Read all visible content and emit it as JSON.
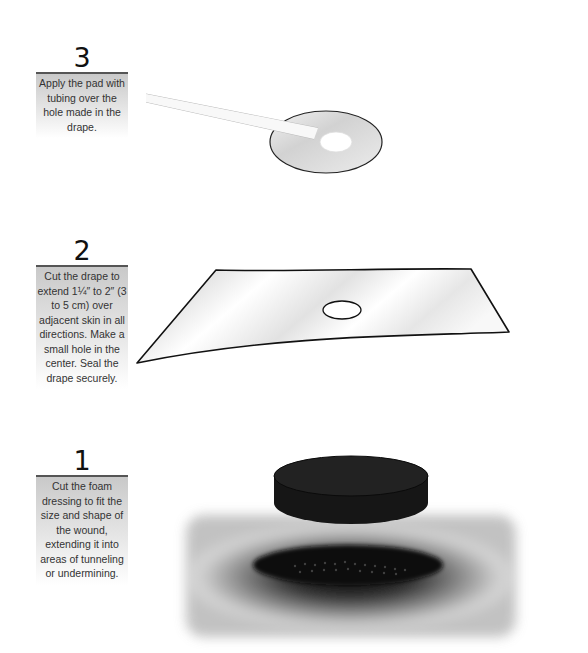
{
  "steps": [
    {
      "number": "3",
      "text": "Apply the pad with tubing over the hole made in the drape."
    },
    {
      "number": "2",
      "text": "Cut the drape to extend 1¼″ to 2″ (3 to 5 cm) over adjacent skin in all directions. Make a small hole in the center. Seal the drape securely."
    },
    {
      "number": "1",
      "text": "Cut the foam dressing to fit the size and shape of the wound, extending it into areas of tunneling or undermining."
    }
  ],
  "illustrations": {
    "step3": "pad-with-tubing-on-drape",
    "step2": "transparent-drape-with-center-hole",
    "step1": "black-foam-dressing-above-wound"
  }
}
